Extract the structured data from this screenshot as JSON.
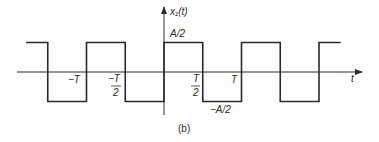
{
  "figure": {
    "caption": "(b)",
    "signal_name": "x₁(t)",
    "x_axis_label": "t",
    "amplitude_high_label": "A/2",
    "amplitude_low_label": "−A/2",
    "tick_labels": [
      {
        "id": "neg-T",
        "text": "−T"
      },
      {
        "id": "neg-T-half-num",
        "text": "−T"
      },
      {
        "id": "neg-T-half-den",
        "text": "2"
      },
      {
        "id": "T-half-num",
        "text": "T"
      },
      {
        "id": "T-half-den",
        "text": "2"
      },
      {
        "id": "T",
        "text": "T"
      }
    ],
    "waveform": {
      "type": "square-wave",
      "high": 0.5,
      "low": -0.5,
      "amplitude_unit": "A",
      "period_unit": "T",
      "transitions_in_T": [
        -1.5,
        -1,
        -0.5,
        0,
        0.5,
        1,
        1.5,
        2
      ],
      "t_start_in_T": -1.78,
      "t_end_in_T": 2.28,
      "start_level": "high"
    },
    "line_color": "#2a2a2a"
  }
}
